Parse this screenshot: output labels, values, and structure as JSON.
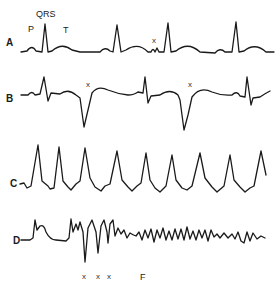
{
  "figure": {
    "traces": [
      {
        "id": "A",
        "label": "A",
        "description": "Normal sinus rhythm with a premature beat"
      },
      {
        "id": "B",
        "label": "B",
        "description": "Sinus rhythm with premature ventricular complexes"
      },
      {
        "id": "C",
        "label": "C",
        "description": "Ventricular tachycardia"
      },
      {
        "id": "D",
        "label": "D",
        "description": "Ventricular premature beats degenerating into ventricular fibrillation"
      }
    ],
    "annotations": {
      "A_wave_labels": [
        "P",
        "QRS",
        "T"
      ],
      "A_marker": "x",
      "B_markers": [
        "x",
        "x"
      ],
      "D_markers": [
        "x",
        "x",
        "x"
      ],
      "D_rhythm_label": "F"
    }
  }
}
